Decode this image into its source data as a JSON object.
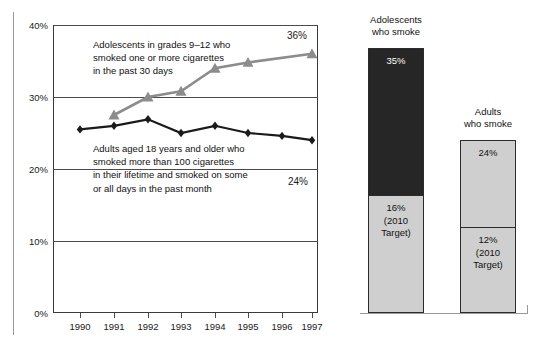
{
  "chart_data": [
    {
      "type": "line",
      "title": "",
      "xlabel": "",
      "ylabel": "",
      "x": [
        "1990",
        "1991",
        "1992",
        "1993",
        "1994",
        "1995",
        "1996",
        "1997"
      ],
      "ylim": [
        0,
        40
      ],
      "yticks": [
        "0%",
        "10%",
        "20%",
        "30%",
        "40%"
      ],
      "grid": true,
      "legend": "inline annotations",
      "series": [
        {
          "name": "Adolescents in grades 9–12 who smoked one or more cigarettes in the past 30 days",
          "marker": "triangle",
          "color": "#8c8c8c",
          "x": [
            "1991",
            "1992",
            "1993",
            "1994",
            "1995",
            "1997"
          ],
          "values": [
            27.5,
            30.0,
            30.8,
            34.0,
            34.8,
            36.0
          ],
          "end_label": "36%"
        },
        {
          "name": "Adults aged 18 years and older who smoked more than 100 cigarettes in their lifetime and smoked on some or all days in the past month",
          "marker": "diamond",
          "color": "#1a1a1a",
          "x": [
            "1990",
            "1991",
            "1992",
            "1993",
            "1994",
            "1995",
            "1996",
            "1997"
          ],
          "values": [
            25.5,
            26.0,
            26.9,
            25.0,
            26.0,
            25.0,
            24.6,
            24.0
          ],
          "end_label": "24%"
        }
      ],
      "annotations": [
        "Adolescents in grades 9–12 who\nsmoked one or more cigarettes\nin the past 30 days",
        "Adults aged 18 years and older who\nsmoked more than 100 cigarettes\nin their lifetime and smoked on some\nor all days in the past month"
      ]
    },
    {
      "type": "bar",
      "title": "",
      "categories": [
        "Adolescents who smoke",
        "Adults who smoke"
      ],
      "ylim": [
        0,
        40
      ],
      "bars": [
        {
          "title": "Adolescents\nwho smoke",
          "current_label": "35%",
          "current_value": 35,
          "current_color": "#262626",
          "target_label": "16%\n(2010\nTarget)",
          "target_value": 16,
          "target_color": "#cfcfcf"
        },
        {
          "title": "Adults\nwho smoke",
          "current_label": "24%",
          "current_value": 24,
          "current_color": "#cfcfcf",
          "target_label": "12%\n(2010\nTarget)",
          "target_value": 12,
          "target_color": "#cfcfcf"
        }
      ]
    }
  ],
  "line_chart": {
    "yticks": [
      {
        "label": "40%",
        "value": 40
      },
      {
        "label": "30%",
        "value": 30
      },
      {
        "label": "20%",
        "value": 20
      },
      {
        "label": "10%",
        "value": 10
      },
      {
        "label": "0%",
        "value": 0
      }
    ],
    "xticks": [
      "1990",
      "1991",
      "1992",
      "1993",
      "1994",
      "1995",
      "1996",
      "1997"
    ],
    "teen_end_label": "36%",
    "adult_end_label": "24%",
    "annot_teen": "Adolescents in grades 9–12 who\nsmoked one or more cigarettes\nin the past 30 days",
    "annot_adult": "Adults aged 18 years and older who\nsmoked more than 100 cigarettes\nin their lifetime and smoked on some\nor all days in the past month"
  },
  "bar_panel": {
    "bar1": {
      "title": "Adolescents\nwho smoke",
      "top_label": "35%",
      "bottom_label": "16%\n(2010\nTarget)"
    },
    "bar2": {
      "title": "Adults\nwho smoke",
      "top_label": "24%",
      "bottom_label": "12%\n(2010\nTarget)"
    }
  }
}
